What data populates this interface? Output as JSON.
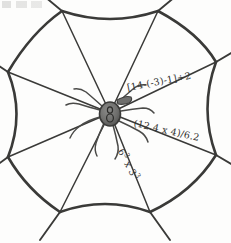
{
  "figure": {
    "style": "hand-drawn pencil sketch",
    "ink_color": "#3a3a38",
    "spider_body_color": "#6e6e6c",
    "background_color": "#fdfdfc"
  },
  "expressions": [
    {
      "id": "expr-1",
      "text": "[14-(-3)-1]÷2",
      "position": "upper-right strand",
      "rotation_deg": -11
    },
    {
      "id": "expr-2",
      "text": "(12.4 x 4)/6.2",
      "position": "middle-right strand",
      "rotation_deg": 13
    },
    {
      "id": "expr-3",
      "base_1": "6",
      "exp_1": "3",
      "operator": " x ",
      "base_2": "3",
      "exp_2": "3",
      "text": "6³ x 3³",
      "position": "lower-right strand",
      "rotation_deg": 62
    }
  ],
  "web": {
    "center": {
      "x": 110,
      "y": 113
    },
    "vertices": [
      {
        "name": "top-left",
        "x": 62,
        "y": 11
      },
      {
        "name": "top-right",
        "x": 158,
        "y": 11
      },
      {
        "name": "right-upper",
        "x": 216,
        "y": 62
      },
      {
        "name": "right-lower",
        "x": 216,
        "y": 155
      },
      {
        "name": "bottom-right",
        "x": 150,
        "y": 212
      },
      {
        "name": "bottom-left",
        "x": 60,
        "y": 212
      },
      {
        "name": "left-lower",
        "x": 8,
        "y": 157
      },
      {
        "name": "left-upper",
        "x": 8,
        "y": 72
      }
    ],
    "spoke_count": 8,
    "rim_segments": 8
  },
  "spider": {
    "body_cx": 110,
    "body_cy": 114,
    "body_rx": 10,
    "body_ry": 12,
    "leg_count": 8
  }
}
